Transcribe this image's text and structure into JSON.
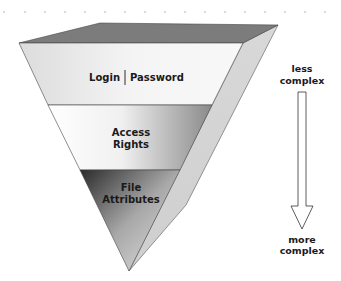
{
  "diagram": {
    "type": "inverted-pyramid",
    "layers": [
      {
        "label_left": "Login",
        "label_right": "Password",
        "separator": "|"
      },
      {
        "line1": "Access",
        "line2": "Rights"
      },
      {
        "line1": "File",
        "line2": "Attributes"
      }
    ],
    "arrow": {
      "top_line1": "less",
      "top_line2": "complex",
      "bottom_line1": "more",
      "bottom_line2": "complex",
      "direction": "down"
    }
  },
  "colors": {
    "top_face": "#7a7a7a",
    "side_face": "#d4d4d4",
    "layer1": "#e6e6e6",
    "layer2": "#f5f5f5",
    "layer3_dark": "#2e2e2e",
    "outline": "#333333"
  }
}
